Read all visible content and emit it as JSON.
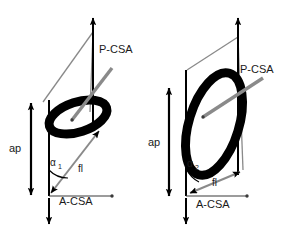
{
  "figure": {
    "type": "scientific-diagram",
    "background_color": "#ffffff",
    "stroke_colors": {
      "black": "#000000",
      "gray": "#8a8a8a",
      "text": "#1a1a1a"
    }
  },
  "panels": [
    {
      "id": "left",
      "name": "panel-small-pennation",
      "labels": {
        "pcsa": "P-CSA",
        "acsa": "A-CSA",
        "ap": "ap",
        "fl": "fl",
        "alpha": "α",
        "alpha_sub": "1"
      },
      "geometry": {
        "pennation_angle_deg": 41,
        "ellipse_rotation_deg": -18,
        "ellipse_rx": 30,
        "ellipse_ry": 15
      }
    },
    {
      "id": "right",
      "name": "panel-large-pennation",
      "labels": {
        "pcsa": "P-CSA",
        "acsa": "A-CSA",
        "ap": "ap",
        "fl": "fl",
        "alpha": "α",
        "alpha_sub": "2"
      },
      "geometry": {
        "pennation_angle_deg": 24,
        "ellipse_rotation_deg": -72,
        "ellipse_rx": 48,
        "ellipse_ry": 22
      }
    }
  ]
}
